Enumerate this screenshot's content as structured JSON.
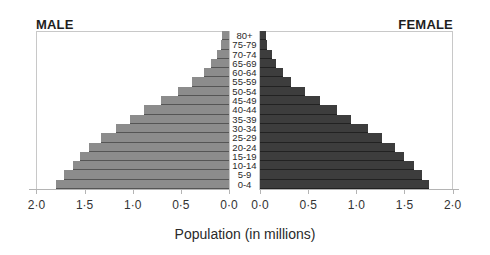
{
  "chart_data": {
    "type": "bar",
    "subtype": "population-pyramid",
    "title": "",
    "xlabel": "Population (in millions)",
    "ylabel": "",
    "categories": [
      "80+",
      "75-79",
      "70-74",
      "65-69",
      "60-64",
      "55-59",
      "50-54",
      "45-49",
      "40-44",
      "35-39",
      "30-34",
      "25-29",
      "20-24",
      "15-19",
      "10-14",
      "5-9",
      "0-4"
    ],
    "series": [
      {
        "name": "MALE",
        "color": "#8c8c8c",
        "values": [
          0.07,
          0.08,
          0.12,
          0.19,
          0.26,
          0.38,
          0.53,
          0.71,
          0.88,
          1.03,
          1.17,
          1.33,
          1.45,
          1.55,
          1.62,
          1.71,
          1.8
        ]
      },
      {
        "name": "FEMALE",
        "color": "#3d3d3d",
        "values": [
          0.06,
          0.07,
          0.12,
          0.17,
          0.24,
          0.32,
          0.47,
          0.62,
          0.8,
          0.95,
          1.12,
          1.27,
          1.4,
          1.5,
          1.6,
          1.68,
          1.75
        ]
      }
    ],
    "xlim": [
      0,
      2.0
    ],
    "male_ticks": [
      "2·0",
      "1·5",
      "1·0",
      "0·5",
      "0·0"
    ],
    "female_ticks": [
      "0·0",
      "0·5",
      "1·0",
      "1·5",
      "2·0"
    ],
    "grid": false,
    "legend": "side titles (MALE left, FEMALE right)"
  },
  "labels": {
    "male_title": "MALE",
    "female_title": "FEMALE",
    "x_axis_title": "Population (in millions)"
  }
}
